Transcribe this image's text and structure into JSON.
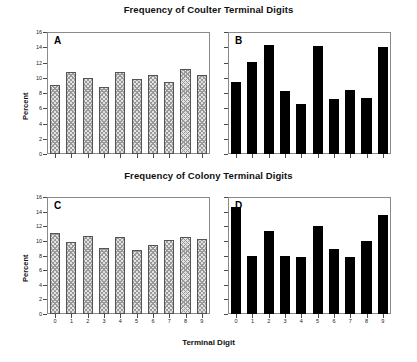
{
  "figure": {
    "title_top": "Frequency of Coulter Terminal Digits",
    "title_bottom": "Frequency of Colony Terminal Digits",
    "xlabel": "Terminal Digit",
    "ylabel": "Percent"
  },
  "axis": {
    "yticks": [
      "16",
      "14",
      "12",
      "10",
      "8",
      "6",
      "4",
      "2",
      "0"
    ],
    "xticks": [
      "0",
      "1",
      "2",
      "3",
      "4",
      "5",
      "6",
      "7",
      "8",
      "9"
    ]
  },
  "panels": {
    "a": {
      "letter": "A"
    },
    "b": {
      "letter": "B"
    },
    "c": {
      "letter": "C"
    },
    "d": {
      "letter": "D"
    }
  },
  "chart_data": [
    {
      "type": "bar",
      "panel": "A",
      "title": "Frequency of Coulter Terminal Digits",
      "xlabel": "Terminal Digit",
      "ylabel": "Percent",
      "categories": [
        "0",
        "1",
        "2",
        "3",
        "4",
        "5",
        "6",
        "7",
        "8",
        "9"
      ],
      "values": [
        9.0,
        10.7,
        10.0,
        8.8,
        10.8,
        9.9,
        10.4,
        9.5,
        11.2,
        10.3
      ],
      "ylim": [
        0,
        16
      ],
      "yticks": [
        0,
        2,
        4,
        6,
        8,
        10,
        12,
        14,
        16
      ],
      "grid": false,
      "bar_style": "hatched",
      "legend": null
    },
    {
      "type": "bar",
      "panel": "B",
      "title": "Frequency of Coulter Terminal Digits",
      "xlabel": "Terminal Digit",
      "ylabel": "Percent",
      "categories": [
        "0",
        "1",
        "2",
        "3",
        "4",
        "5",
        "6",
        "7",
        "8",
        "9"
      ],
      "values": [
        9.4,
        12.1,
        14.3,
        8.2,
        6.6,
        14.2,
        7.2,
        8.4,
        7.4,
        14.0
      ],
      "ylim": [
        0,
        16
      ],
      "yticks": [
        0,
        2,
        4,
        6,
        8,
        10,
        12,
        14,
        16
      ],
      "grid": false,
      "bar_style": "solid",
      "legend": null
    },
    {
      "type": "bar",
      "panel": "C",
      "title": "Frequency of Colony Terminal Digits",
      "xlabel": "Terminal Digit",
      "ylabel": "Percent",
      "categories": [
        "0",
        "1",
        "2",
        "3",
        "4",
        "5",
        "6",
        "7",
        "8",
        "9"
      ],
      "values": [
        11.1,
        9.9,
        10.7,
        9.0,
        10.5,
        8.8,
        9.4,
        10.1,
        10.6,
        10.2
      ],
      "ylim": [
        0,
        16
      ],
      "yticks": [
        0,
        2,
        4,
        6,
        8,
        10,
        12,
        14,
        16
      ],
      "grid": false,
      "bar_style": "hatched",
      "legend": null
    },
    {
      "type": "bar",
      "panel": "D",
      "title": "Frequency of Colony Terminal Digits",
      "xlabel": "Terminal Digit",
      "ylabel": "Percent",
      "categories": [
        "0",
        "1",
        "2",
        "3",
        "4",
        "5",
        "6",
        "7",
        "8",
        "9"
      ],
      "values": [
        14.6,
        8.0,
        11.4,
        7.9,
        7.8,
        12.1,
        8.9,
        7.8,
        10.0,
        13.6
      ],
      "ylim": [
        0,
        16
      ],
      "yticks": [
        0,
        2,
        4,
        6,
        8,
        10,
        12,
        14,
        16
      ],
      "grid": false,
      "bar_style": "solid",
      "legend": null
    }
  ]
}
